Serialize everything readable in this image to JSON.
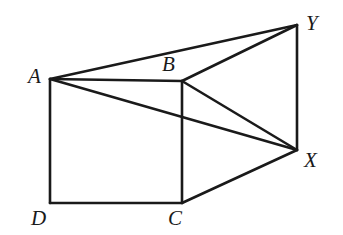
{
  "figure": {
    "background_color": "#ffffff",
    "line_color": "#1a1a1a",
    "canvas": {
      "width": 343,
      "height": 235
    },
    "vertices": [
      {
        "id": "A",
        "label": "A",
        "x": 50,
        "y": 79,
        "label_x": 28,
        "label_y": 66
      },
      {
        "id": "B",
        "label": "B",
        "x": 182,
        "y": 81,
        "label_x": 162,
        "label_y": 54
      },
      {
        "id": "C",
        "label": "C",
        "x": 182,
        "y": 203,
        "label_x": 168,
        "label_y": 208
      },
      {
        "id": "D",
        "label": "D",
        "x": 50,
        "y": 203,
        "label_x": 31,
        "label_y": 208
      },
      {
        "id": "X",
        "label": "X",
        "x": 297,
        "y": 150,
        "label_x": 304,
        "label_y": 150
      },
      {
        "id": "Y",
        "label": "Y",
        "x": 297,
        "y": 25,
        "label_x": 306,
        "label_y": 13
      }
    ],
    "edges": [
      {
        "id": "AB",
        "from": "A",
        "to": "B"
      },
      {
        "id": "BC",
        "from": "B",
        "to": "C"
      },
      {
        "id": "CD",
        "from": "C",
        "to": "D"
      },
      {
        "id": "DA",
        "from": "D",
        "to": "A"
      },
      {
        "id": "AY",
        "from": "A",
        "to": "Y"
      },
      {
        "id": "BY",
        "from": "B",
        "to": "Y"
      },
      {
        "id": "YX",
        "from": "Y",
        "to": "X"
      },
      {
        "id": "AX",
        "from": "A",
        "to": "X"
      },
      {
        "id": "BX",
        "from": "B",
        "to": "X"
      },
      {
        "id": "CX",
        "from": "C",
        "to": "X"
      }
    ]
  }
}
